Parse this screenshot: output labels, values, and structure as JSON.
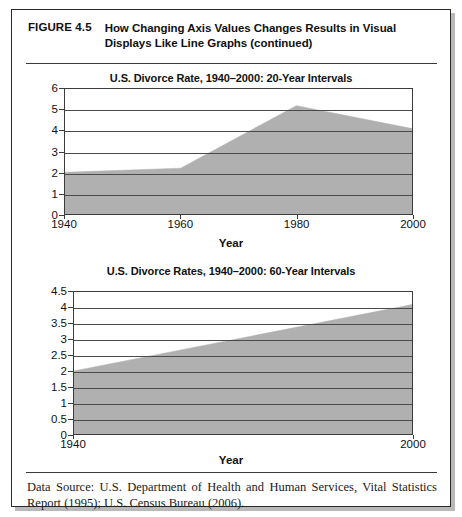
{
  "figure": {
    "number": "FIGURE 4.5",
    "title": "How Changing Axis Values Changes Results in Visual Displays Like Line Graphs (continued)",
    "data_source": "Data Source: U.S. Department of Health and Human Services, Vital Statistics Report (1995); U.S. Census Bureau (2006)."
  },
  "chart_data": [
    {
      "type": "area",
      "title": "U.S. Divorce Rate, 1940–2000: 20-Year Intervals",
      "xlabel": "Year",
      "ylabel": "",
      "x": [
        1940,
        1960,
        1980,
        2000
      ],
      "values": [
        2.0,
        2.2,
        5.2,
        4.1
      ],
      "xtick_labels": [
        "1940",
        "1960",
        "1980",
        "2000"
      ],
      "ytick_labels": [
        "0",
        "1",
        "2",
        "3",
        "4",
        "5",
        "6"
      ],
      "ytick_values": [
        0,
        1,
        2,
        3,
        4,
        5,
        6
      ],
      "xlim": [
        1940,
        2000
      ],
      "ylim": [
        0,
        6
      ],
      "grid": true,
      "legend": "none",
      "fill_color": "#b0b0b0"
    },
    {
      "type": "area",
      "title": "U.S. Divorce Rates, 1940–2000: 60-Year Intervals",
      "xlabel": "Year",
      "ylabel": "",
      "x": [
        1940,
        2000
      ],
      "values": [
        2.0,
        4.1
      ],
      "xtick_labels": [
        "1940",
        "2000"
      ],
      "ytick_labels": [
        "0",
        "0.5",
        "1",
        "1.5",
        "2",
        "2.5",
        "3",
        "3.5",
        "4",
        "4.5"
      ],
      "ytick_values": [
        0,
        0.5,
        1,
        1.5,
        2,
        2.5,
        3,
        3.5,
        4,
        4.5
      ],
      "xlim": [
        1940,
        2000
      ],
      "ylim": [
        0,
        4.5
      ],
      "grid": true,
      "legend": "none",
      "fill_color": "#b0b0b0"
    }
  ]
}
